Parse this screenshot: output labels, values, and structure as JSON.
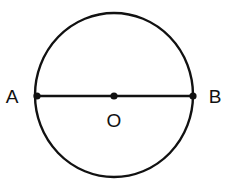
{
  "diagram": {
    "type": "circle-with-diameter",
    "circle": {
      "center_label": "O",
      "cx": 114,
      "cy": 95,
      "rx": 79,
      "ry": 82,
      "stroke": "#111111"
    },
    "points": [
      {
        "label": "A",
        "x": 36,
        "y": 96,
        "label_x": 12,
        "label_y": 103
      },
      {
        "label": "O",
        "x": 114,
        "y": 96,
        "label_x": 114,
        "label_y": 127
      },
      {
        "label": "B",
        "x": 194,
        "y": 96,
        "label_x": 215,
        "label_y": 103
      }
    ],
    "segment": {
      "from": "A",
      "to": "B",
      "description": "diameter AB through center O"
    }
  }
}
